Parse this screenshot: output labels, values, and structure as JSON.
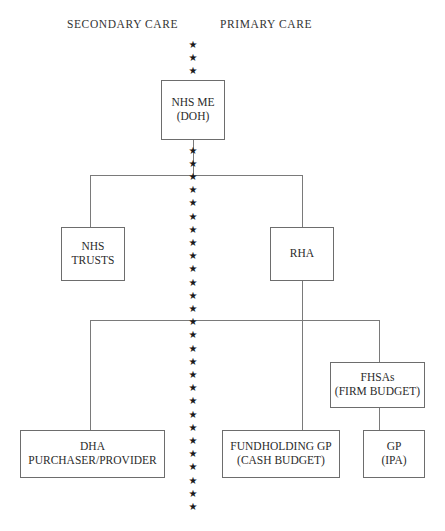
{
  "diagram": {
    "headers": [
      {
        "label": "SECONDARY CARE",
        "x": 67,
        "y": 18
      },
      {
        "label": "PRIMARY CARE",
        "x": 220,
        "y": 18
      }
    ],
    "nodes": [
      {
        "id": "nhs-me",
        "lines": [
          "NHS ME",
          "(DOH)"
        ],
        "x": 161,
        "y": 80,
        "w": 64,
        "h": 60
      },
      {
        "id": "nhs-trusts",
        "lines": [
          "NHS",
          "TRUSTS"
        ],
        "x": 61,
        "y": 227,
        "w": 64,
        "h": 54
      },
      {
        "id": "rha",
        "lines": [
          "RHA"
        ],
        "x": 270,
        "y": 227,
        "w": 64,
        "h": 54
      },
      {
        "id": "fhsas",
        "lines": [
          "FHSAs",
          "(FIRM BUDGET)"
        ],
        "x": 330,
        "y": 362,
        "w": 95,
        "h": 46
      },
      {
        "id": "dha",
        "lines": [
          "DHA",
          "PURCHASER/PROVIDER"
        ],
        "x": 20,
        "y": 430,
        "w": 145,
        "h": 48
      },
      {
        "id": "fundholding-gp",
        "lines": [
          "FUNDHOLDING GP",
          "(CASH BUDGET)"
        ],
        "x": 222,
        "y": 430,
        "w": 118,
        "h": 48
      },
      {
        "id": "gp-ipa",
        "lines": [
          "GP",
          "(IPA)"
        ],
        "x": 363,
        "y": 430,
        "w": 62,
        "h": 48
      }
    ],
    "connectors": [
      {
        "id": "nhsme-to-bus1",
        "orient": "v",
        "x": 193,
        "y": 140,
        "len": 36
      },
      {
        "id": "bus-upper",
        "orient": "h",
        "x": 90,
        "y": 175,
        "len": 213
      },
      {
        "id": "bus-upper-left-drop",
        "orient": "v",
        "x": 90,
        "y": 175,
        "len": 53
      },
      {
        "id": "bus-upper-right-drop",
        "orient": "v",
        "x": 302,
        "y": 175,
        "len": 53
      },
      {
        "id": "rha-to-bus2",
        "orient": "v",
        "x": 302,
        "y": 281,
        "len": 150
      },
      {
        "id": "bus-lower",
        "orient": "h",
        "x": 90,
        "y": 320,
        "len": 290
      },
      {
        "id": "bus-lower-left-drop",
        "orient": "v",
        "x": 90,
        "y": 320,
        "len": 111
      },
      {
        "id": "bus-lower-right-drop",
        "orient": "v",
        "x": 379,
        "y": 320,
        "len": 43
      },
      {
        "id": "fhsas-to-gp",
        "orient": "v",
        "x": 379,
        "y": 408,
        "len": 23
      }
    ],
    "star_column": {
      "label": "dotted-divider-between-secondary-and-primary-care",
      "glyph": "★",
      "x": 193,
      "y_start": 45,
      "y_end": 512,
      "spacing": 13.2,
      "count": 36,
      "color": "#1a1a1a"
    },
    "colors": {
      "background": "#ffffff",
      "box_border": "#6d6d6d",
      "connector": "#7a7a7a",
      "text": "#2b2b2b",
      "header_text": "#333333"
    }
  }
}
